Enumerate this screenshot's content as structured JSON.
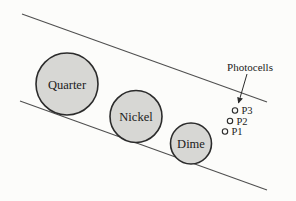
{
  "figure": {
    "background": "#fcfcfa",
    "colors": {
      "coin_fill": "#d7d7d4",
      "coin_stroke": "#2b2b2b",
      "incline_line": "#4f4f4f",
      "text": "#1b1b1b"
    },
    "coins": [
      {
        "label": "Quarter"
      },
      {
        "label": "Nickel"
      },
      {
        "label": "Dime"
      }
    ],
    "photocells": {
      "caption": "Photocells",
      "sensors": [
        {
          "label": "P3"
        },
        {
          "label": "P2"
        },
        {
          "label": "P1"
        }
      ]
    }
  }
}
